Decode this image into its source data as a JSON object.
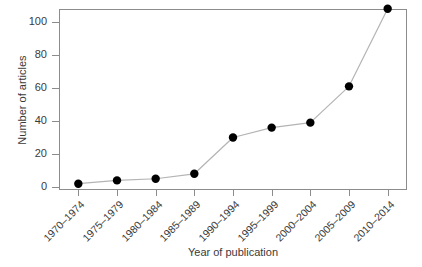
{
  "chart_data": {
    "type": "line",
    "title": "",
    "xlabel": "Year of publication",
    "ylabel": "Number of articles",
    "categories": [
      "1970–1974",
      "1975–1979",
      "1980–1984",
      "1985–1989",
      "1990–1994",
      "1995–1999",
      "2000–2004",
      "2005–2009",
      "2010–2014"
    ],
    "values": [
      2,
      4,
      5,
      8,
      30,
      36,
      39,
      61,
      108
    ],
    "ylim": [
      0,
      112
    ],
    "yticks": [
      0,
      20,
      40,
      60,
      80,
      100
    ],
    "ytick_labels": [
      "0",
      "20",
      "40",
      "60",
      "80",
      "100"
    ],
    "grid": false,
    "legend": false,
    "marker": "filled-circle",
    "marker_color": "#000000",
    "line_color": "#b4b4b4",
    "frame_color": "#8c8c8c",
    "text_color": "#3a3a3a",
    "background": "#ffffff"
  }
}
